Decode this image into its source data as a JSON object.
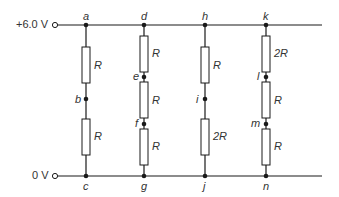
{
  "diagram": {
    "rails": {
      "top_label": "+6.0 V",
      "bottom_label": "0 V"
    },
    "nodes": {
      "a": "a",
      "b": "b",
      "c": "c",
      "d": "d",
      "e": "e",
      "f": "f",
      "g": "g",
      "h": "h",
      "i": "i",
      "j": "j",
      "k": "k",
      "l": "l",
      "m": "m",
      "n": "n"
    },
    "branches": [
      {
        "name": "branch-abc",
        "resistors": [
          "R",
          "R"
        ],
        "nodes": [
          "a",
          "b",
          "c"
        ]
      },
      {
        "name": "branch-defg",
        "resistors": [
          "R",
          "R",
          "R"
        ],
        "nodes": [
          "d",
          "e",
          "f",
          "g"
        ]
      },
      {
        "name": "branch-hij",
        "resistors": [
          "R",
          "2R"
        ],
        "nodes": [
          "h",
          "i",
          "j"
        ]
      },
      {
        "name": "branch-klmn",
        "resistors": [
          "2R",
          "R",
          "R"
        ],
        "nodes": [
          "k",
          "l",
          "m",
          "n"
        ]
      }
    ],
    "colors": {
      "wire": "#1a1a1a",
      "text": "#333333",
      "resistor_fill": "#ffffff"
    }
  }
}
